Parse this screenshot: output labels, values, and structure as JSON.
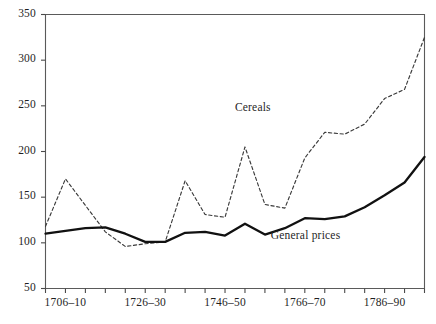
{
  "chart_data": {
    "type": "line",
    "title": "",
    "subtitle": "",
    "xlabel": "",
    "ylabel": "",
    "xlim_index": [
      0,
      19
    ],
    "ylim": [
      50,
      350
    ],
    "grid": false,
    "legend_position": "inline-annotations",
    "y_ticks": [
      50,
      100,
      150,
      200,
      250,
      300,
      350
    ],
    "x_categories": [
      "1701–05",
      "1706–10",
      "1711–15",
      "1716–20",
      "1721–25",
      "1726–30",
      "1731–35",
      "1736–40",
      "1741–45",
      "1746–50",
      "1751–55",
      "1756–60",
      "1761–65",
      "1766–70",
      "1771–75",
      "1776–80",
      "1781–85",
      "1786–90",
      "1791–95",
      "1796–1800"
    ],
    "x_tick_labels_shown": [
      {
        "index": 1,
        "label": "1706–10"
      },
      {
        "index": 5,
        "label": "1726–30"
      },
      {
        "index": 9,
        "label": "1746–50"
      },
      {
        "index": 13,
        "label": "1766–70"
      },
      {
        "index": 17,
        "label": "1786–90"
      }
    ],
    "series": [
      {
        "name": "Cereals",
        "style": "dashed",
        "color": "#3a3a3a",
        "annotation": "Cereals",
        "annotation_index": 11.1,
        "annotation_value": 246,
        "values": [
          118,
          170,
          141,
          112,
          96,
          99,
          101,
          168,
          131,
          128,
          205,
          142,
          138,
          193,
          221,
          219,
          230,
          258,
          268,
          325
        ]
      },
      {
        "name": "General prices",
        "style": "solid",
        "color": "#111111",
        "annotation": "General prices",
        "annotation_index": 13.6,
        "annotation_value": 106,
        "values": [
          110,
          113,
          116,
          117,
          110,
          101,
          101,
          111,
          112,
          108,
          121,
          109,
          116,
          127,
          126,
          129,
          139,
          152,
          166,
          194
        ]
      }
    ]
  },
  "axes": {
    "y_axis_name": "value-axis",
    "x_axis_name": "period-axis"
  }
}
